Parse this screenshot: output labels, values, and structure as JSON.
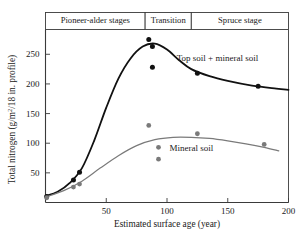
{
  "chart_data": {
    "type": "scatter",
    "title": "",
    "xlabel": "Estimated surface age (year)",
    "ylabel": "Total nitrogen (g/m²/18 in. profile)",
    "ylabel_parts": {
      "pre": "Total nitrogen (g/m",
      "sup1": "2",
      "mid": "/18 in. profile)"
    },
    "xlim": [
      0,
      200
    ],
    "ylim": [
      0,
      280
    ],
    "xticks": [
      50,
      100,
      150,
      200
    ],
    "xtick_labels": [
      "50",
      "100",
      "150",
      "200"
    ],
    "yticks": [
      50,
      100,
      150,
      200,
      250
    ],
    "ytick_labels": [
      "50",
      "100",
      "150",
      "200",
      "250"
    ],
    "grid": false,
    "legend_position": "inline-annotations",
    "stage_bands": [
      {
        "label": "Pioneer-alder stages",
        "x_start": 0,
        "x_end": 82
      },
      {
        "label": "Transition",
        "x_start": 82,
        "x_end": 120
      },
      {
        "label": "Spruce stage",
        "x_start": 120,
        "x_end": 200
      }
    ],
    "series": [
      {
        "name": "Top soil + mineral soil",
        "color": "#111111",
        "annotation": "Top soil + mineral soil",
        "annotation_x": 108,
        "annotation_y": 244,
        "points": [
          {
            "x": 1,
            "y": 10
          },
          {
            "x": 23,
            "y": 38
          },
          {
            "x": 28,
            "y": 51
          },
          {
            "x": 85,
            "y": 275
          },
          {
            "x": 88,
            "y": 263
          },
          {
            "x": 88,
            "y": 228
          },
          {
            "x": 125,
            "y": 218
          },
          {
            "x": 175,
            "y": 196
          }
        ],
        "curve": [
          {
            "x": 0,
            "y": 11
          },
          {
            "x": 10,
            "y": 18
          },
          {
            "x": 20,
            "y": 33
          },
          {
            "x": 30,
            "y": 58
          },
          {
            "x": 40,
            "y": 104
          },
          {
            "x": 50,
            "y": 160
          },
          {
            "x": 60,
            "y": 209
          },
          {
            "x": 70,
            "y": 243
          },
          {
            "x": 80,
            "y": 263
          },
          {
            "x": 90,
            "y": 268
          },
          {
            "x": 100,
            "y": 258
          },
          {
            "x": 110,
            "y": 240
          },
          {
            "x": 120,
            "y": 225
          },
          {
            "x": 135,
            "y": 213
          },
          {
            "x": 150,
            "y": 205
          },
          {
            "x": 170,
            "y": 197
          },
          {
            "x": 190,
            "y": 192
          },
          {
            "x": 200,
            "y": 190
          }
        ]
      },
      {
        "name": "Mineral soil",
        "color": "#7a7a7a",
        "annotation": "Mineral soil",
        "annotation_x": 102,
        "annotation_y": 93,
        "points": [
          {
            "x": 1,
            "y": 8
          },
          {
            "x": 23,
            "y": 26
          },
          {
            "x": 28,
            "y": 31
          },
          {
            "x": 85,
            "y": 130
          },
          {
            "x": 93,
            "y": 93
          },
          {
            "x": 93,
            "y": 73
          },
          {
            "x": 125,
            "y": 116
          },
          {
            "x": 180,
            "y": 98
          }
        ],
        "curve": [
          {
            "x": 0,
            "y": 9
          },
          {
            "x": 15,
            "y": 20
          },
          {
            "x": 30,
            "y": 36
          },
          {
            "x": 45,
            "y": 58
          },
          {
            "x": 60,
            "y": 79
          },
          {
            "x": 75,
            "y": 96
          },
          {
            "x": 90,
            "y": 106
          },
          {
            "x": 105,
            "y": 110
          },
          {
            "x": 120,
            "y": 110
          },
          {
            "x": 135,
            "y": 108
          },
          {
            "x": 150,
            "y": 104
          },
          {
            "x": 165,
            "y": 99
          },
          {
            "x": 180,
            "y": 93
          },
          {
            "x": 192,
            "y": 87
          }
        ]
      }
    ]
  }
}
